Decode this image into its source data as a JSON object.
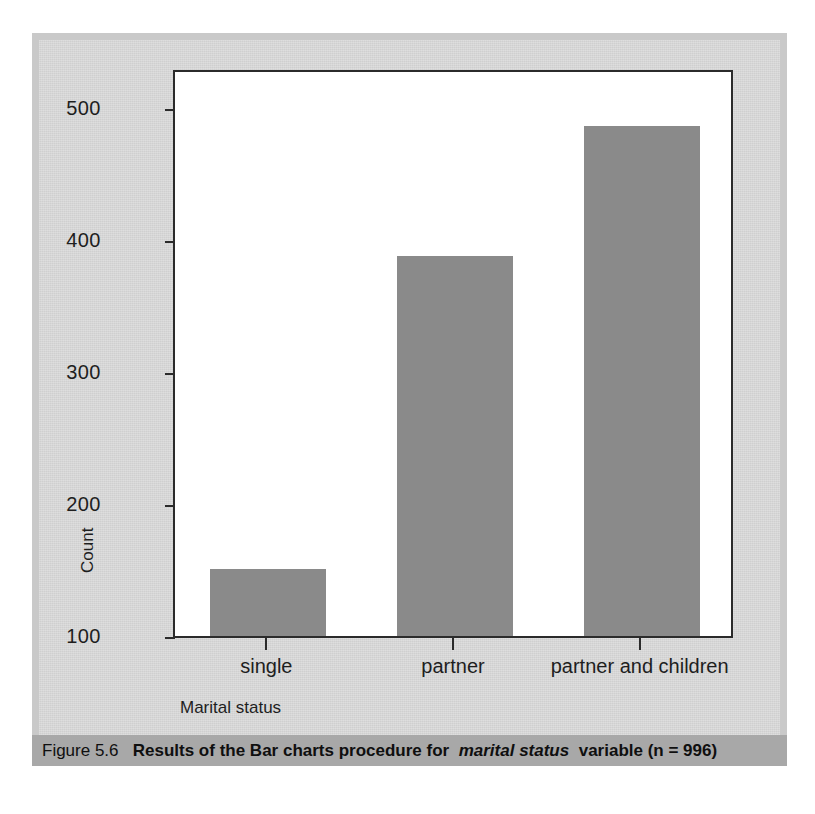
{
  "figure": {
    "caption_label": "Figure 5.6",
    "caption_title_part1": "Results of the Bar charts procedure for",
    "caption_title_italic": "marital status",
    "caption_title_part2": "variable (n = 996)"
  },
  "colors": {
    "bar_fill": "#8a8a8a",
    "plot_background": "#ffffff",
    "plate_background": "#d5d5d5",
    "block_border": "#c9c9c9",
    "caption_band": "#a8a8a8",
    "axis_line": "#2b2b2b"
  },
  "chart_data": {
    "type": "bar",
    "title": "",
    "subtitle": "",
    "categories": [
      "single",
      "partner",
      "partner and children"
    ],
    "values": [
      151,
      388,
      486
    ],
    "series": [
      {
        "name": "Count",
        "values": [
          151,
          388,
          486
        ]
      }
    ],
    "xlabel": "Marital status",
    "ylabel": "Count",
    "ylim": [
      100,
      530
    ],
    "yticks": [
      100,
      200,
      300,
      400,
      500
    ],
    "ytick_labels": [
      "100",
      "200",
      "300",
      "400",
      "500"
    ],
    "grid": false,
    "legend": false,
    "legend_position": "none",
    "total_n": 996,
    "annotations": []
  }
}
